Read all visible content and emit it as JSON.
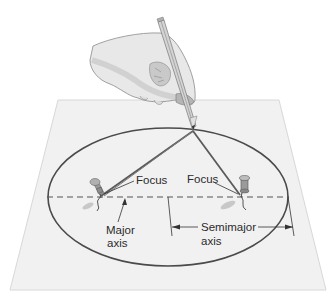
{
  "diagram": {
    "labels": {
      "focus_left": "Focus",
      "focus_right": "Focus",
      "major_axis_line1": "Major",
      "major_axis_line2": "axis",
      "semimajor_axis_line1": "Semimajor",
      "semimajor_axis_line2": "axis"
    },
    "colors": {
      "paper": "#f2f2f2",
      "paper_edge": "#d6d6d6",
      "ellipse": "#4a4a4a",
      "string": "#5a5a5a",
      "axis_dash": "#555555",
      "pin": "#8a8a8a",
      "hand": "#e6e6e6",
      "text": "#2b2b2b"
    }
  }
}
